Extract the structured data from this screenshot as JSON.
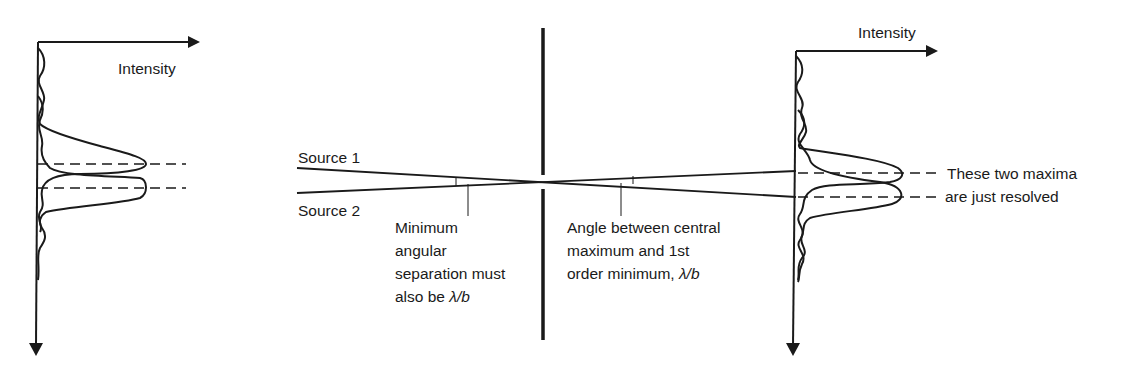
{
  "figure": {
    "left_pattern": {
      "axis_label": "Intensity"
    },
    "right_pattern": {
      "axis_label": "Intensity",
      "annotation_line1": "These two maxima",
      "annotation_line2": "are just resolved"
    },
    "sources": {
      "source1": "Source 1",
      "source2": "Source 2"
    },
    "left_note": {
      "line1": "Minimum",
      "line2": "angular",
      "line3": "separation must",
      "line4_prefix": "also be ",
      "symbol": "λ/b"
    },
    "right_note": {
      "line1": "Angle between central",
      "line2": "maximum and 1st",
      "line3_prefix": "order minimum, ",
      "symbol": "λ/b"
    }
  },
  "colors": {
    "ink": "#1a1a1a",
    "background": "#ffffff"
  }
}
